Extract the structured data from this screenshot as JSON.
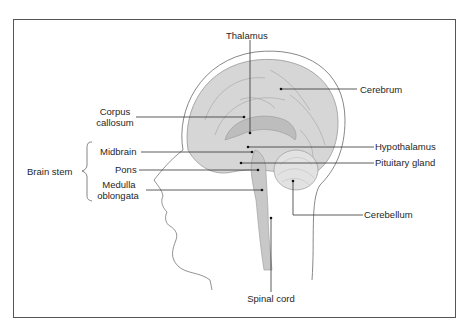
{
  "diagram": {
    "type": "anatomical-illustration",
    "labels": {
      "thalamus": "Thalamus",
      "cerebrum": "Cerebrum",
      "corpus_callosum_line1": "Corpus",
      "corpus_callosum_line2": "callosum",
      "midbrain": "Midbrain",
      "hypothalamus": "Hypothalamus",
      "pituitary_gland": "Pituitary gland",
      "brain_stem": "Brain stem",
      "pons": "Pons",
      "medulla_line1": "Medulla",
      "medulla_line2": "oblongata",
      "cerebellum": "Cerebellum",
      "spinal_cord": "Spinal cord"
    },
    "groups": [
      {
        "name": "Brain stem",
        "members": [
          "Midbrain",
          "Pons",
          "Medulla oblongata"
        ]
      }
    ],
    "colors": {
      "frame": "#555555",
      "leader_line": "#333333",
      "tissue": "#cfcfcf",
      "outline": "#777777"
    }
  }
}
